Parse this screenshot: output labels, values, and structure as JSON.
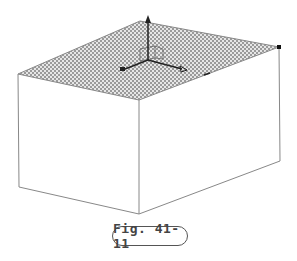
{
  "figure": {
    "caption": "Fig. 41-11",
    "colors": {
      "edge": "#888888",
      "hatch_dark": "#9a9a9a",
      "hatch_light": "#e6e6e6",
      "axis": "#222222"
    },
    "box": {
      "top_face": [
        [
          140,
          21
        ],
        [
          279,
          47
        ],
        [
          139,
          100
        ],
        [
          18,
          74
        ]
      ],
      "bottom_corners": {
        "left": [
          19,
          187
        ],
        "front": [
          139,
          214
        ],
        "right": [
          280,
          161
        ]
      }
    },
    "gizmo": {
      "origin": [
        148,
        60
      ],
      "z_tip": [
        148,
        17
      ],
      "x_tip": [
        123,
        70
      ],
      "y_tip": [
        185,
        70
      ]
    }
  }
}
